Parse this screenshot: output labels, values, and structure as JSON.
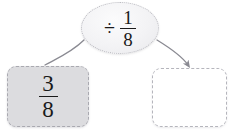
{
  "problem": {
    "type": "fraction-division-flow",
    "operand": {
      "numerator": "3",
      "denominator": "8",
      "display": "3/8"
    },
    "operator": {
      "symbol": "÷",
      "icon": "division-sign-icon",
      "numerator": "1",
      "denominator": "8",
      "display": "÷ 1/8"
    },
    "result": {
      "value": "",
      "placeholder": ""
    }
  },
  "arrows": {
    "input_arrow": {
      "name": "input-curve",
      "has_arrowhead": false
    },
    "output_arrow": {
      "name": "output-arrow",
      "has_arrowhead": true
    }
  },
  "colors": {
    "background": "#ffffff",
    "operand_box_fill": "#dcdcdf",
    "operand_box_border": "#a9a9b0",
    "result_box_fill": "#ffffff",
    "result_box_border": "#b5b5bc",
    "ellipse_fill": "#f3f3f5",
    "ellipse_border": "#b9b9bf",
    "arrow_stroke": "#8a8a92",
    "text": "#1a1a1a"
  }
}
